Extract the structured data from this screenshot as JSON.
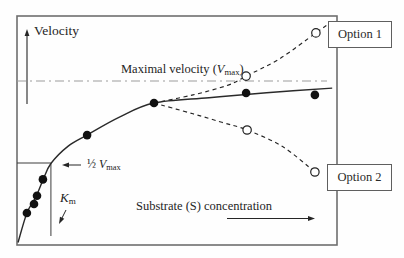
{
  "figure": {
    "background": "#fefefe",
    "frame_color": "#6f6f6f",
    "ink_color": "#262626",
    "vmax_line_color": "#9c9c9c"
  },
  "labels": {
    "y_axis": "Velocity",
    "vmax": {
      "prefix": "Maximal velocity (",
      "var": "V",
      "sub": "max",
      "suffix": ")"
    },
    "half_vmax": {
      "prefix": "½ ",
      "var": "V",
      "sub": "max"
    },
    "km": {
      "var": "K",
      "sub": "m"
    },
    "x_axis": "Substrate (S) concentration",
    "option1": "Option 1",
    "option2": "Option 2"
  },
  "chart_data": {
    "type": "scatter",
    "title": "",
    "xlabel": "Substrate (S) concentration",
    "ylabel": "Velocity",
    "x_range": [
      0,
      10
    ],
    "y_range": [
      0,
      1.45
    ],
    "x_units": "arbitrary (no ticks shown)",
    "y_units": "fraction of Vmax (no ticks shown)",
    "vmax_level": 1.0,
    "half_vmax_level": 0.5,
    "km_x": 1.06,
    "grid": false,
    "series": [
      {
        "name": "observed-data",
        "marker": "filled-circle",
        "points": [
          [
            0.31,
            0.195
          ],
          [
            0.53,
            0.25
          ],
          [
            0.625,
            0.3
          ],
          [
            0.81,
            0.4
          ],
          [
            2.19,
            0.67
          ],
          [
            4.28,
            0.866
          ],
          [
            7.16,
            0.927
          ],
          [
            9.31,
            0.915
          ]
        ]
      },
      {
        "name": "option1-extrapolation",
        "marker": "open-circle",
        "points": [
          [
            7.16,
            1.03
          ],
          [
            9.34,
            1.293
          ]
        ]
      },
      {
        "name": "option2-extrapolation",
        "marker": "open-circle",
        "points": [
          [
            7.19,
            0.701
          ],
          [
            9.31,
            0.445
          ]
        ]
      }
    ],
    "curves": {
      "fit": [
        [
          0.03,
          0.015
        ],
        [
          0.31,
          0.195
        ],
        [
          0.58,
          0.29
        ],
        [
          0.82,
          0.4
        ],
        [
          1.06,
          0.497
        ],
        [
          1.6,
          0.603
        ],
        [
          2.2,
          0.672
        ],
        [
          3.2,
          0.78
        ],
        [
          4.28,
          0.866
        ],
        [
          6.0,
          0.898
        ],
        [
          7.8,
          0.928
        ],
        [
          9.85,
          0.957
        ]
      ],
      "option1": [
        [
          4.28,
          0.866
        ],
        [
          5.5,
          0.915
        ],
        [
          6.6,
          0.975
        ],
        [
          7.16,
          1.03
        ],
        [
          8.2,
          1.135
        ],
        [
          9.34,
          1.293
        ],
        [
          9.72,
          1.345
        ]
      ],
      "option2": [
        [
          4.28,
          0.866
        ],
        [
          5.5,
          0.8
        ],
        [
          6.4,
          0.748
        ],
        [
          7.19,
          0.701
        ],
        [
          8.3,
          0.6
        ],
        [
          9.31,
          0.445
        ]
      ]
    },
    "annotations": [
      "Maximal velocity (Vmax) dash-dot reference line",
      "½ Vmax level marked by short horizontal line with arrow",
      "Km marked by vertical line at substrate giving half-maximal velocity",
      "Dashed branches lead to Option 1 (rising) and Option 2 (falling)"
    ]
  }
}
